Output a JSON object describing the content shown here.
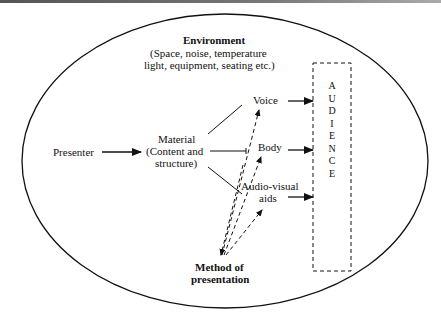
{
  "environment": {
    "title": "Environment",
    "line1": "(Space, noise, temperature",
    "line2": "light, equipment, seating etc.)"
  },
  "nodes": {
    "presenter": "Presenter",
    "material_l1": "Material",
    "material_l2": "(Content and",
    "material_l3": "structure)",
    "voice": "Voice",
    "body": "Body",
    "av_l1": "Audio-visual",
    "av_l2": "aids",
    "method_l1": "Method of",
    "method_l2": "presentation",
    "audience": [
      "A",
      "U",
      "D",
      "I",
      "E",
      "N",
      "C",
      "E"
    ]
  },
  "colors": {
    "line": "#111111",
    "background": "#ffffff"
  }
}
